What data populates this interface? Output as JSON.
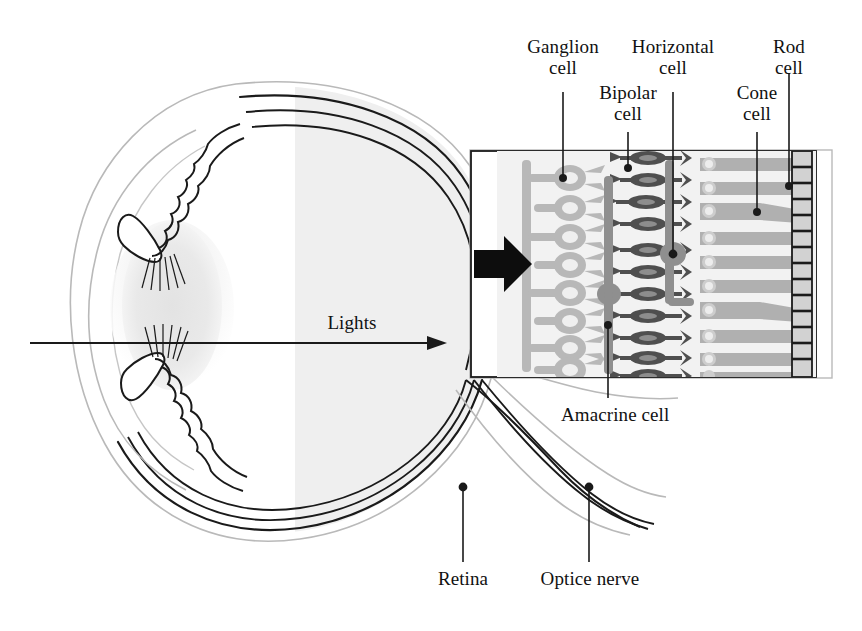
{
  "figure": {
    "background_color": "#ffffff",
    "ink_color": "#111111",
    "light_gray": "#d9d9d9",
    "mid_gray": "#a8a8a8",
    "dark_gray": "#5a5a5a"
  },
  "labels": {
    "ganglion_cell": "Ganglion\ncell",
    "bipolar_cell": "Bipolar\ncell",
    "horizontal_cell": "Horizontal\ncell",
    "cone_cell": "Cone\ncell",
    "rod_cell": "Rod\ncell",
    "amacrine_cell": "Amacrine cell",
    "retina": "Retina",
    "optic_nerve": "Optice nerve",
    "lights": "Lights"
  },
  "eye": {
    "name": "eye-cross-section",
    "parts": [
      "sclera",
      "choroid",
      "retina-layer",
      "cornea",
      "iris",
      "ciliary-body",
      "lens",
      "vitreous-body",
      "optic-nerve"
    ],
    "lens_fill": "#ededed",
    "vitreous_fill": "#f0f0f0"
  },
  "inset": {
    "name": "retina-inset",
    "box": {
      "x": 470,
      "y": 150,
      "width": 362,
      "height": 228
    },
    "layers": [
      "ganglion-cell-layer",
      "bipolar-cell-layer",
      "horizontal-cell-layer",
      "photoreceptor-layer",
      "pigment-epithelium"
    ],
    "ganglion_cell_count": 8,
    "bipolar_cell_count": 11,
    "photoreceptor_count": 10,
    "pigment_segment_count": 14,
    "arrow_direction": "right"
  },
  "leaders": {
    "ganglion_cell": {
      "x": 563,
      "y_from": 92,
      "y_to": 178
    },
    "bipolar_cell": {
      "x": 628,
      "y_from": 132,
      "y_to": 168
    },
    "horizontal_cell": {
      "x": 673,
      "y_from": 92,
      "y_to": 254
    },
    "cone_cell": {
      "x": 757,
      "y_from": 132,
      "y_to": 212
    },
    "rod_cell": {
      "x": 789,
      "y_from": 73,
      "y_to": 186
    },
    "amacrine_cell": {
      "x": 608,
      "y_from": 325,
      "y_to": 398
    },
    "retina": {
      "x": 463,
      "y_from": 487,
      "y_to": 562
    },
    "optic_nerve": {
      "x": 589,
      "y_from": 487,
      "y_to": 562
    }
  }
}
